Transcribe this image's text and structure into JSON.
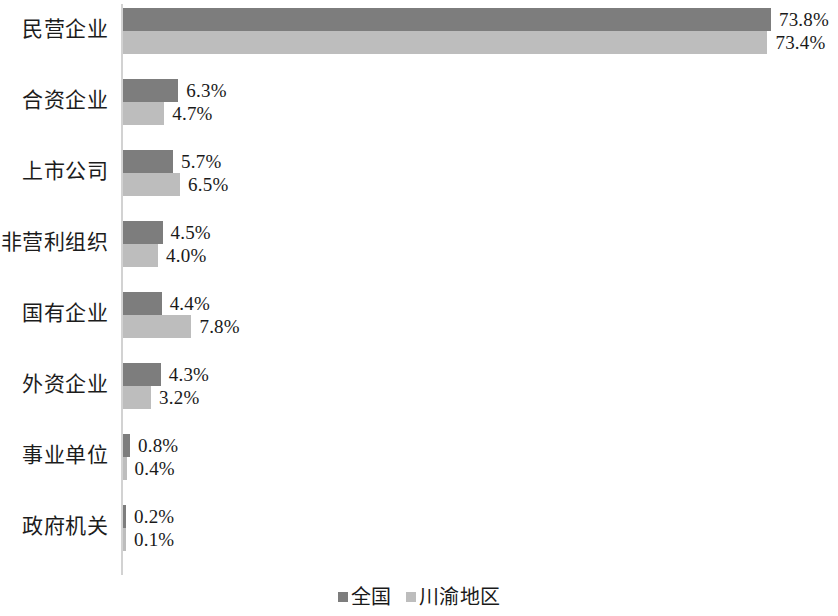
{
  "chart_data": {
    "type": "bar",
    "orientation": "horizontal",
    "title": "",
    "subtitle": "",
    "xlabel": "",
    "ylabel": "",
    "grid": false,
    "legend_position": "bottom-center",
    "axis_range": [
      0,
      80
    ],
    "value_suffix": "%",
    "categories": [
      "民营企业",
      "合资企业",
      "上市公司",
      "非营利组织",
      "国有企业",
      "外资企业",
      "事业单位",
      "政府机关"
    ],
    "series": [
      {
        "name": "全国",
        "color": "#7d7d7d",
        "values": [
          73.8,
          6.3,
          5.7,
          4.5,
          4.4,
          4.3,
          0.8,
          0.2
        ],
        "labels": [
          "73.8%",
          "6.3%",
          "5.7%",
          "4.5%",
          "4.4%",
          "4.3%",
          "0.8%",
          "0.2%"
        ]
      },
      {
        "name": "川渝地区",
        "color": "#bdbdbd",
        "values": [
          73.4,
          4.7,
          6.5,
          4.0,
          7.8,
          3.2,
          0.4,
          0.1
        ],
        "labels": [
          "73.4%",
          "4.7%",
          "6.5%",
          "4.0%",
          "7.8%",
          "3.2%",
          "0.4%",
          "0.1%"
        ]
      }
    ]
  },
  "legend": {
    "items": [
      {
        "label": "全国",
        "color": "#7d7d7d"
      },
      {
        "label": "川渝地区",
        "color": "#bdbdbd"
      }
    ]
  }
}
